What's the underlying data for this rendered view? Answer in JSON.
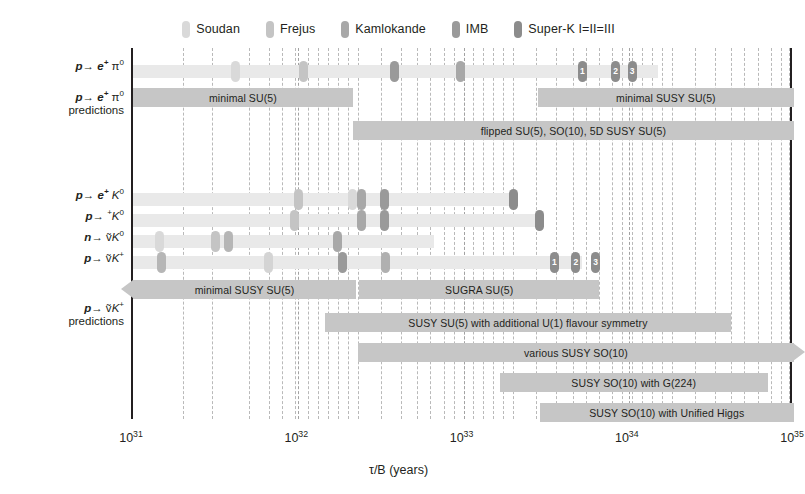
{
  "legend": {
    "items": [
      {
        "label": "Soudan",
        "color": "#d9d9d9"
      },
      {
        "label": "Frejus",
        "color": "#c4c4c4"
      },
      {
        "label": "Kamlokande",
        "color": "#a8a8a8"
      },
      {
        "label": "IMB",
        "color": "#9a9a9a"
      },
      {
        "label": "Super-K I=II=III",
        "color": "#8c8c8c"
      }
    ]
  },
  "axis": {
    "title": "τ/B (years)",
    "ticks": [
      {
        "mantissa": "10",
        "exp": "31",
        "value": 31
      },
      {
        "mantissa": "10",
        "exp": "32",
        "value": 32
      },
      {
        "mantissa": "10",
        "exp": "33",
        "value": 33
      },
      {
        "mantissa": "10",
        "exp": "34",
        "value": 34
      },
      {
        "mantissa": "10",
        "exp": "35",
        "value": 35
      }
    ],
    "xlim": [
      31,
      35
    ],
    "grid": true
  },
  "rows": {
    "r1_label_html": "<span class=\"eq\">p</span>→ <span class=\"eq\">e<sup>+</sup></span> π<sup>0</sup>",
    "r1_pred_html": "<span class=\"eq\">p</span>→ <span class=\"eq\">e<sup>+</sup></span> π<sup>0</sup><br><span class=\"pred\">predictions</span>",
    "r3_label_html": "<span class=\"eq\">p</span>→ <span class=\"eq\">e<sup>+</sup></span> <span class=\"sub\">K</span><sup>0</sup>",
    "r4_label_html": "<span class=\"eq\">p</span>→ <sup>+</sup><span class=\"sub\">K</span><sup>0</sup>",
    "r5_label_html": "<span class=\"eq\">n</span>→ ṽ<span class=\"sub\">K</span><sup>0</sup>",
    "r6_label_html": "<span class=\"eq\">p</span>→ ṽ<span class=\"sub\">K</span><sup>+</sup>",
    "r7_pred_html": "<span class=\"eq\">p</span>→ ṽ<span class=\"sub\">K</span><sup>+</sup><br><span class=\"pred\">predictions</span>"
  },
  "chart_data": {
    "type": "bar",
    "title": "",
    "xlabel": "τ/B (years)",
    "ylabel": "",
    "xlim": [
      31,
      35
    ],
    "xscale": "log10",
    "grid": true,
    "legend_position": "top-center",
    "limit_rows": [
      {
        "channel": "p → e+ π0",
        "bar_start": 31.0,
        "bar_end": 34.18,
        "markers": [
          {
            "experiment": "Soudan",
            "value": 31.62,
            "color": "#d9d9d9",
            "label": ""
          },
          {
            "experiment": "Frejus",
            "value": 32.03,
            "color": "#c4c4c4",
            "label": ""
          },
          {
            "experiment": "IMB",
            "value": 32.58,
            "color": "#9a9a9a",
            "label": ""
          },
          {
            "experiment": "Kamlokande",
            "value": 32.98,
            "color": "#a8a8a8",
            "label": ""
          },
          {
            "experiment": "Super-K I",
            "value": 33.72,
            "color": "#8c8c8c",
            "label": "1"
          },
          {
            "experiment": "Super-K II",
            "value": 33.92,
            "color": "#8c8c8c",
            "label": "2"
          },
          {
            "experiment": "Super-K III",
            "value": 34.02,
            "color": "#8c8c8c",
            "label": "3"
          }
        ]
      },
      {
        "channel": "p → e+ K0",
        "bar_start": 31.0,
        "bar_end": 33.33,
        "markers": [
          {
            "experiment": "Frejus",
            "value": 32.0,
            "color": "#c4c4c4",
            "label": ""
          },
          {
            "experiment": "Soudan",
            "value": 32.33,
            "color": "#d9d9d9",
            "label": ""
          },
          {
            "experiment": "Kamlokande",
            "value": 32.38,
            "color": "#a8a8a8",
            "label": ""
          },
          {
            "experiment": "IMB",
            "value": 32.52,
            "color": "#9a9a9a",
            "label": ""
          },
          {
            "experiment": "Super-K I",
            "value": 33.3,
            "color": "#8c8c8c",
            "label": ""
          }
        ]
      },
      {
        "channel": "p → μ+ K0",
        "bar_start": 31.0,
        "bar_end": 33.48,
        "markers": [
          {
            "experiment": "Frejus",
            "value": 31.98,
            "color": "#c4c4c4",
            "label": ""
          },
          {
            "experiment": "Kamlokande",
            "value": 32.38,
            "color": "#a8a8a8",
            "label": ""
          },
          {
            "experiment": "IMB",
            "value": 32.52,
            "color": "#9a9a9a",
            "label": ""
          },
          {
            "experiment": "Super-K I",
            "value": 33.46,
            "color": "#8c8c8c",
            "label": ""
          }
        ]
      },
      {
        "channel": "n → ν̄ K0",
        "bar_start": 31.0,
        "bar_end": 32.82,
        "markers": [
          {
            "experiment": "Soudan",
            "value": 31.16,
            "color": "#d9d9d9",
            "label": ""
          },
          {
            "experiment": "Frejus",
            "value": 31.5,
            "color": "#c4c4c4",
            "label": ""
          },
          {
            "experiment": "Soudan2",
            "value": 31.58,
            "color": "#b6b6b6",
            "label": ""
          },
          {
            "experiment": "Kamlokande",
            "value": 32.24,
            "color": "#a8a8a8",
            "label": ""
          }
        ]
      },
      {
        "channel": "p → ν̄ K+",
        "bar_start": 31.0,
        "bar_end": 33.72,
        "markers": [
          {
            "experiment": "Soudan",
            "value": 31.17,
            "color": "#b6b6b6",
            "label": ""
          },
          {
            "experiment": "Frejus",
            "value": 31.82,
            "color": "#d4d4d4",
            "label": ""
          },
          {
            "experiment": "Kamlokande",
            "value": 32.27,
            "color": "#9a9a9a",
            "label": ""
          },
          {
            "experiment": "IMB",
            "value": 32.53,
            "color": "#b0b0b0",
            "label": ""
          },
          {
            "experiment": "Super-K I",
            "value": 33.55,
            "color": "#8c8c8c",
            "label": "1"
          },
          {
            "experiment": "Super-K II",
            "value": 33.68,
            "color": "#8c8c8c",
            "label": "2"
          },
          {
            "experiment": "Super-K III",
            "value": 33.8,
            "color": "#8c8c8c",
            "label": "3"
          }
        ]
      }
    ],
    "prediction_bars": [
      {
        "group": "p → e+ π0",
        "label": "minimal SU(5)",
        "start": 31.0,
        "end": 32.33,
        "arrow_left": false,
        "arrow_right": false,
        "row": 0
      },
      {
        "group": "p → e+ π0",
        "label": "minimal SUSY SU(5)",
        "start": 33.45,
        "end": 35.0,
        "arrow_left": false,
        "arrow_right": false,
        "row": 0
      },
      {
        "group": "p → e+ π0",
        "label": "flipped SU(5), SO(10), 5D SUSY SU(5)",
        "start": 32.33,
        "end": 35.0,
        "arrow_left": false,
        "arrow_right": false,
        "row": 1
      },
      {
        "group": "p → ν̄ K+",
        "label": "minimal SUSY SU(5)",
        "start": 31.0,
        "end": 32.35,
        "arrow_left": true,
        "arrow_right": false,
        "row": 0
      },
      {
        "group": "p → ν̄ K+",
        "label": "SUGRA SU(5)",
        "start": 32.37,
        "end": 33.82,
        "arrow_left": false,
        "arrow_right": false,
        "row": 0
      },
      {
        "group": "p → ν̄ K+",
        "label": "SUSY SU(5) with additional U(1) flavour symmetry",
        "start": 32.16,
        "end": 34.62,
        "arrow_left": false,
        "arrow_right": false,
        "row": 1
      },
      {
        "group": "p → ν̄ K+",
        "label": "various SUSY SO(10)",
        "start": 32.36,
        "end": 35.0,
        "arrow_left": false,
        "arrow_right": true,
        "row": 2
      },
      {
        "group": "p → ν̄ K+",
        "label": "SUSY SO(10) with G(224)",
        "start": 33.22,
        "end": 34.84,
        "arrow_left": false,
        "arrow_right": false,
        "row": 3
      },
      {
        "group": "p → ν̄ K+",
        "label": "SUSY SO(10) with Unified Higgs",
        "start": 33.46,
        "end": 35.0,
        "arrow_left": false,
        "arrow_right": false,
        "row": 4
      }
    ],
    "gridline_values": [
      31.3,
      31.48,
      31.7,
      31.82,
      31.9,
      31.98,
      32.06,
      32.12,
      32.18,
      32.24,
      32.3,
      32.36,
      32.5,
      32.62,
      32.72,
      32.8,
      32.88,
      32.94,
      33.0,
      33.06,
      33.12,
      33.18,
      33.24,
      33.3,
      33.44,
      33.56,
      33.66,
      33.74,
      33.82,
      33.9,
      33.96,
      34.02,
      34.08,
      34.14,
      34.2,
      34.26,
      34.4,
      34.52,
      34.62,
      34.7,
      34.78,
      34.86,
      34.92,
      34.97
    ]
  }
}
